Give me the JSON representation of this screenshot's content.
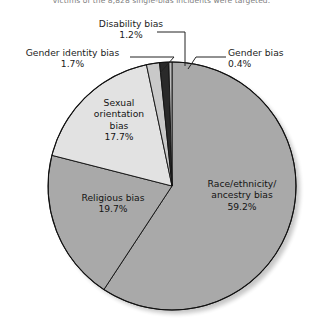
{
  "caption": {
    "text": "victims of the 8,828 single-bias incidents were targeted."
  },
  "chart_data": {
    "type": "pie",
    "title": "",
    "subtitle": "",
    "xlabel": "",
    "ylabel": "",
    "legend_position": "none",
    "grid": false,
    "units": "percent",
    "start_angle_deg": 0,
    "direction": "clockwise",
    "categories": [
      "Race/ethnicity/ancestry bias",
      "Religious bias",
      "Sexual orientation bias",
      "Gender identity bias",
      "Disability bias",
      "Gender bias"
    ],
    "values": [
      59.2,
      19.7,
      17.7,
      1.7,
      1.2,
      0.4
    ],
    "colors": [
      "#a9a9a9",
      "#a9a9a9",
      "#e2e2e2",
      "#c9c9c9",
      "#2a2a2a",
      "#bdbdbd"
    ],
    "slices": [
      {
        "name": "Race/ethnicity/ancestry bias",
        "value": 59.2,
        "value_text": "59.2%",
        "label_line1": "Race/ethnicity/",
        "label_line2": "ancestry bias",
        "color": "#a9a9a9",
        "label_placement": "inside"
      },
      {
        "name": "Religious bias",
        "value": 19.7,
        "value_text": "19.7%",
        "label_line1": "Religious bias",
        "label_line2": "",
        "color": "#a9a9a9",
        "label_placement": "inside"
      },
      {
        "name": "Sexual orientation bias",
        "value": 17.7,
        "value_text": "17.7%",
        "label_line1": "Sexual",
        "label_line2": "orientation",
        "label_line3": "bias",
        "color": "#e2e2e2",
        "label_placement": "inside"
      },
      {
        "name": "Gender identity bias",
        "value": 1.7,
        "value_text": "1.7%",
        "label_line1": "Gender identity bias",
        "color": "#c9c9c9",
        "label_placement": "callout-left"
      },
      {
        "name": "Disability bias",
        "value": 1.2,
        "value_text": "1.2%",
        "label_line1": "Disability bias",
        "color": "#2a2a2a",
        "label_placement": "callout-top"
      },
      {
        "name": "Gender bias",
        "value": 0.4,
        "value_text": "0.4%",
        "label_line1": "Gender bias",
        "color": "#bdbdbd",
        "label_placement": "callout-right"
      }
    ]
  }
}
